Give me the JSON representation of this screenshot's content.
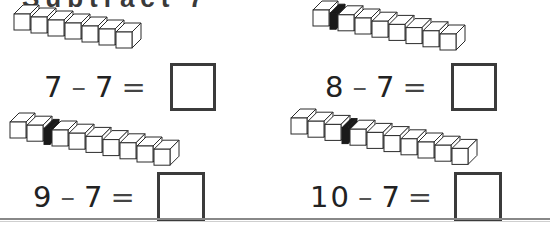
{
  "worksheet": {
    "heading_partial": "Subtract 7",
    "separator_color": "#1a1a1a",
    "cube_outline_color": "#2b2b2b",
    "box_border_color": "#3b3b3b",
    "rule_color": "#888888",
    "problems": [
      {
        "id": "problem-1",
        "minuend": "7",
        "operator": "–",
        "subtrahend": "7",
        "equals": "=",
        "answer": "",
        "cubes_total": 7,
        "cubes_before_separator": 0,
        "cubes_after_separator": 7,
        "has_separator": false
      },
      {
        "id": "problem-2",
        "minuend": "8",
        "operator": "–",
        "subtrahend": "7",
        "equals": "=",
        "answer": "",
        "cubes_total": 8,
        "cubes_before_separator": 1,
        "cubes_after_separator": 7,
        "has_separator": true
      },
      {
        "id": "problem-3",
        "minuend": "9",
        "operator": "–",
        "subtrahend": "7",
        "equals": "=",
        "answer": "",
        "cubes_total": 9,
        "cubes_before_separator": 2,
        "cubes_after_separator": 7,
        "has_separator": true
      },
      {
        "id": "problem-4",
        "minuend": "10",
        "operator": "–",
        "subtrahend": "7",
        "equals": "=",
        "answer": "",
        "cubes_total": 10,
        "cubes_before_separator": 3,
        "cubes_after_separator": 7,
        "has_separator": true
      }
    ]
  }
}
